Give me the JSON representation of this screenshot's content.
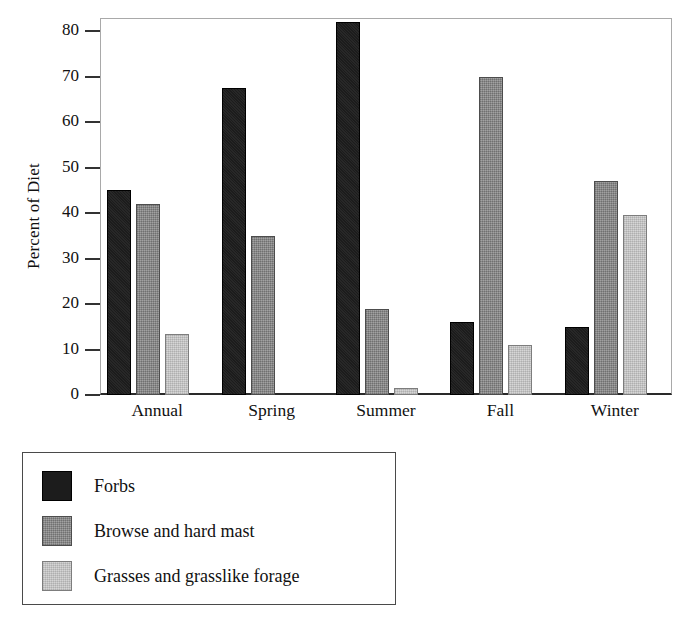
{
  "chart_data": {
    "type": "bar",
    "title": "",
    "subtitle": "",
    "xlabel": "",
    "ylabel": "Percent of Diet",
    "categories": [
      "Annual",
      "Spring",
      "Summer",
      "Fall",
      "Winter"
    ],
    "series": [
      {
        "name": "Forbs",
        "color": "#1c1c1c",
        "values": [
          45,
          67.5,
          82,
          16,
          15
        ]
      },
      {
        "name": "Browse and hard mast",
        "color": "#8b8b8b",
        "values": [
          42,
          35,
          19,
          70,
          47
        ]
      },
      {
        "name": "Grasses and grasslike forage",
        "color": "#cacaca",
        "values": [
          13.5,
          0,
          1.5,
          11,
          39.5
        ]
      }
    ],
    "ylim": [
      0,
      84
    ],
    "yticks": [
      0,
      10,
      20,
      30,
      40,
      50,
      60,
      70,
      80
    ],
    "ytick_labels": [
      "0",
      "10",
      "20",
      "30",
      "40",
      "50",
      "60",
      "70",
      "80"
    ],
    "grid": false,
    "legend_position": "below-plot-left",
    "legend_entries": [
      "Forbs",
      "Browse and hard mast",
      "Grasses and grasslike forage"
    ]
  }
}
